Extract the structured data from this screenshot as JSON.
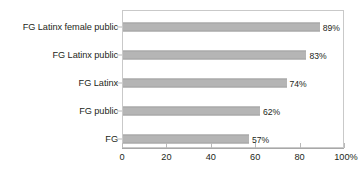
{
  "chart_data": {
    "type": "bar",
    "orientation": "horizontal",
    "title": "",
    "subtitle": "",
    "xlabel": "",
    "ylabel": "",
    "categories": [
      "FG Latinx female public",
      "FG Latinx public",
      "FG Latinx",
      "FG public",
      "FG"
    ],
    "values": [
      89,
      83,
      74,
      62,
      57
    ],
    "value_labels": [
      "89%",
      "83%",
      "74%",
      "62%",
      "57%"
    ],
    "xlim": [
      0,
      100
    ],
    "xticks": [
      0,
      20,
      40,
      60,
      80,
      100
    ],
    "xtick_labels": [
      "0",
      "20",
      "40",
      "60",
      "80",
      "100%"
    ],
    "grid": false,
    "legend": false,
    "legend_position": "none",
    "bar_color": "#b5b5b5",
    "bar_edge_color": "#a3a3a3",
    "frame_color": "#c9c9c9",
    "text_color": "#231f20",
    "background_color": "#ffffff"
  }
}
